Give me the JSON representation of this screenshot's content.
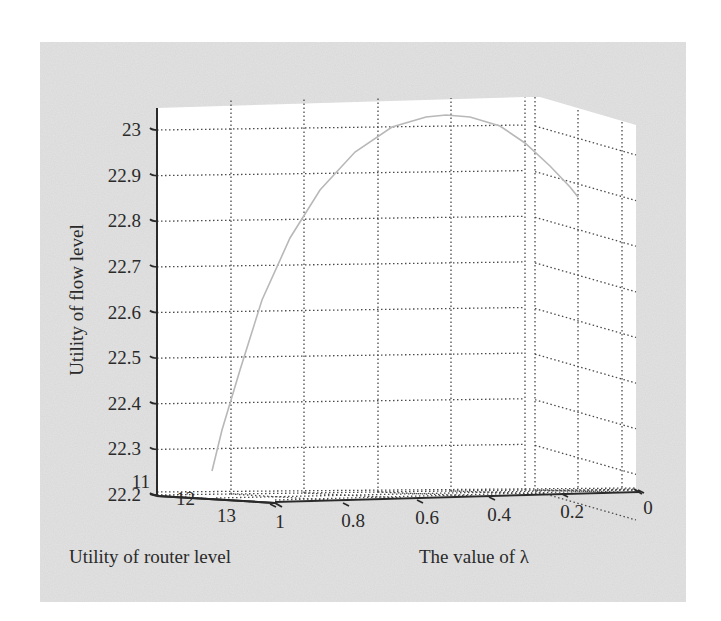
{
  "chart_data": {
    "type": "line",
    "projection": "3d",
    "title": "",
    "xlabel": "The value of λ",
    "ylabel": "Utility of router level",
    "zlabel": "Utility of flow level",
    "x_ticks": [
      "1",
      "0.8",
      "0.6",
      "0.4",
      "0.2",
      "0"
    ],
    "y_ticks": [
      "11",
      "12",
      "13"
    ],
    "z_ticks": [
      "23",
      "22.9",
      "22.8",
      "22.7",
      "22.6",
      "22.5",
      "22.4",
      "22.3",
      "22.2"
    ],
    "xlim": [
      1,
      0
    ],
    "ylim": [
      11,
      13
    ],
    "zlim": [
      22.2,
      23.1
    ],
    "grid": true,
    "legend": null,
    "series": [
      {
        "name": "utility curve",
        "color": "#b8b8b8",
        "points": [
          {
            "lambda": 1.0,
            "router_utility": 12.6,
            "flow_utility": 22.22
          },
          {
            "lambda": 0.9,
            "router_utility": 12.5,
            "flow_utility": 22.55
          },
          {
            "lambda": 0.8,
            "router_utility": 12.4,
            "flow_utility": 22.78
          },
          {
            "lambda": 0.7,
            "router_utility": 12.3,
            "flow_utility": 22.93
          },
          {
            "lambda": 0.6,
            "router_utility": 12.2,
            "flow_utility": 23.01
          },
          {
            "lambda": 0.5,
            "router_utility": 12.1,
            "flow_utility": 23.04
          },
          {
            "lambda": 0.4,
            "router_utility": 12.0,
            "flow_utility": 23.02
          },
          {
            "lambda": 0.3,
            "router_utility": 11.9,
            "flow_utility": 22.95
          },
          {
            "lambda": 0.2,
            "router_utility": 11.8,
            "flow_utility": 22.8
          }
        ]
      }
    ]
  },
  "figure": {
    "background_color": "#e2e2e2",
    "plot_color": "#ffffff",
    "axis_color": "#2a2a2a",
    "grid_color": "#555555"
  }
}
